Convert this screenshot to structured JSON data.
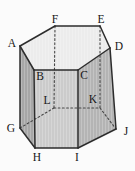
{
  "figure": {
    "kind": "hexagonal-prism-diagram",
    "background_color": "#fbfbfb",
    "solid_edge_color": "#2d2d2d",
    "hidden_edge_color": "#474747",
    "label_color": "#161616",
    "vertices": {
      "A": {
        "label": "A",
        "x": 20,
        "y": 46,
        "label_x": 12,
        "label_y": 43,
        "hidden": false
      },
      "B": {
        "label": "B",
        "x": 34,
        "y": 70,
        "label_x": 40,
        "label_y": 76,
        "hidden": false
      },
      "C": {
        "label": "C",
        "x": 78,
        "y": 70,
        "label_x": 84,
        "label_y": 75,
        "hidden": false
      },
      "D": {
        "label": "D",
        "x": 110,
        "y": 48,
        "label_x": 119,
        "label_y": 46,
        "hidden": false
      },
      "E": {
        "label": "E",
        "x": 100,
        "y": 26,
        "label_x": 101,
        "label_y": 19,
        "hidden": false
      },
      "F": {
        "label": "F",
        "x": 55,
        "y": 26,
        "label_x": 55,
        "label_y": 19,
        "hidden": false
      },
      "G": {
        "label": "G",
        "x": 20,
        "y": 128,
        "label_x": 11,
        "label_y": 128,
        "hidden": false
      },
      "H": {
        "label": "H",
        "x": 35,
        "y": 148,
        "label_x": 37,
        "label_y": 157,
        "hidden": false
      },
      "I": {
        "label": "I",
        "x": 78,
        "y": 148,
        "label_x": 77,
        "label_y": 157,
        "hidden": false
      },
      "J": {
        "label": "J",
        "x": 116,
        "y": 129,
        "label_x": 126,
        "label_y": 131,
        "hidden": false
      },
      "K": {
        "label": "K",
        "x": 100,
        "y": 108,
        "label_x": 93,
        "label_y": 99,
        "hidden": true
      },
      "L": {
        "label": "L",
        "x": 54,
        "y": 108,
        "label_x": 47,
        "label_y": 100,
        "hidden": true
      }
    },
    "faces": [
      {
        "name": "left",
        "vertices": [
          "A",
          "B",
          "H",
          "G"
        ],
        "fill": "#a7a7a7"
      },
      {
        "name": "front",
        "vertices": [
          "B",
          "C",
          "I",
          "H"
        ],
        "fill": "#cbcbcb"
      },
      {
        "name": "right",
        "vertices": [
          "C",
          "D",
          "J",
          "I"
        ],
        "fill": "#b4b4b4"
      },
      {
        "name": "top",
        "vertices": [
          "A",
          "B",
          "C",
          "D",
          "E",
          "F"
        ],
        "fill": "#ececec"
      }
    ],
    "edges": {
      "solid": [
        [
          "A",
          "F"
        ],
        [
          "F",
          "E"
        ],
        [
          "E",
          "D"
        ],
        [
          "D",
          "C"
        ],
        [
          "C",
          "B"
        ],
        [
          "B",
          "A"
        ],
        [
          "A",
          "G"
        ],
        [
          "B",
          "H"
        ],
        [
          "C",
          "I"
        ],
        [
          "D",
          "J"
        ],
        [
          "G",
          "H"
        ],
        [
          "H",
          "I"
        ],
        [
          "I",
          "J"
        ]
      ],
      "hidden": [
        [
          "F",
          "L"
        ],
        [
          "E",
          "K"
        ],
        [
          "L",
          "K"
        ],
        [
          "G",
          "L"
        ],
        [
          "K",
          "J"
        ]
      ]
    },
    "solid_edge_width": 1.5,
    "hidden_edge_width": 1.1,
    "hidden_dash_pattern": "1.8 2.4"
  }
}
